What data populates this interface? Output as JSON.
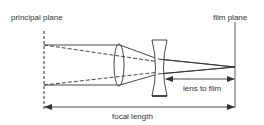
{
  "diagram": {
    "labels": {
      "principal_plane": "principal plane",
      "film_plane": "film plane",
      "lens_to_film": "lens to film",
      "focal_length": "focal length"
    },
    "elements": [
      {
        "id": "principal-plane",
        "type": "dashed-vertical-line"
      },
      {
        "id": "convex-lens",
        "type": "converging-lens"
      },
      {
        "id": "concave-lens",
        "type": "diverging-lens"
      },
      {
        "id": "film-plane",
        "type": "solid-vertical-line"
      },
      {
        "id": "lens-to-film-arrow",
        "type": "dimension-arrow"
      },
      {
        "id": "focal-length-arrow",
        "type": "dimension-arrow"
      }
    ],
    "colors": {
      "stroke": "#333333",
      "background": "#ffffff"
    }
  }
}
